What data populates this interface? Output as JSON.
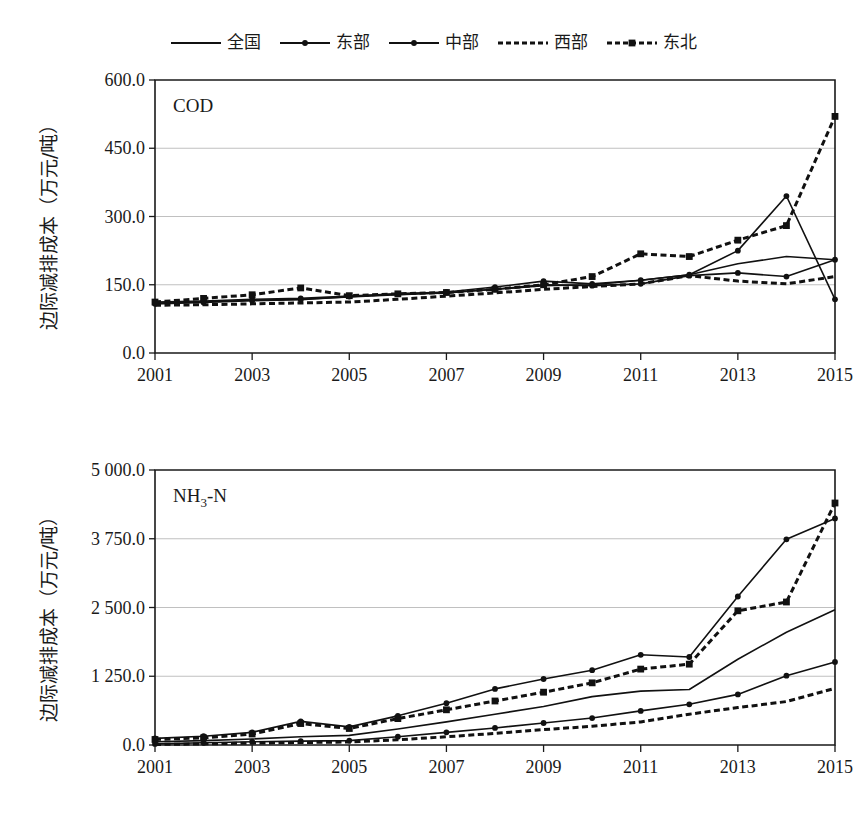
{
  "legend": {
    "entries": [
      {
        "label": "全国",
        "key": "solid-line",
        "style": "solid",
        "marker": "none"
      },
      {
        "label": "东部",
        "key": "solid-line-dot",
        "style": "solid",
        "marker": "circle"
      },
      {
        "label": "中部",
        "key": "solid-line-dot",
        "style": "solid",
        "marker": "circle"
      },
      {
        "label": "西部",
        "key": "dashed-line",
        "style": "dashed",
        "marker": "none"
      },
      {
        "label": "东北",
        "key": "dashed-line-square",
        "style": "dashed",
        "marker": "square"
      }
    ]
  },
  "colors": {
    "ink": "#111111",
    "grid": "#b9b9b9",
    "background": "#ffffff"
  },
  "chart_data": [
    {
      "type": "line",
      "id": "cod",
      "title": "COD",
      "xlabel": "",
      "ylabel": "边际减排成本（万元/吨）",
      "x": [
        2001,
        2002,
        2003,
        2004,
        2005,
        2006,
        2007,
        2008,
        2009,
        2010,
        2011,
        2012,
        2013,
        2014,
        2015
      ],
      "xticks": [
        2001,
        2003,
        2005,
        2007,
        2009,
        2011,
        2013,
        2015
      ],
      "xticklabels": [
        "2001",
        "2003",
        "2005",
        "2007",
        "2009",
        "2011",
        "2013",
        "2015"
      ],
      "yticks": [
        0,
        150,
        300,
        450,
        600
      ],
      "yticklabels": [
        "0.0",
        "150.0",
        "300.0",
        "450.0",
        "600.0"
      ],
      "xlim": [
        2001,
        2015
      ],
      "ylim": [
        0,
        600
      ],
      "grid": true,
      "legend_position": "top-center",
      "series": [
        {
          "name": "全国",
          "style": "solid",
          "marker": "none",
          "values": [
            110,
            112,
            116,
            118,
            123,
            128,
            132,
            140,
            148,
            150,
            160,
            172,
            196,
            212,
            205
          ]
        },
        {
          "name": "东部",
          "style": "solid",
          "marker": "circle",
          "values": [
            108,
            111,
            115,
            117,
            124,
            130,
            134,
            145,
            158,
            152,
            160,
            172,
            225,
            345,
            118
          ]
        },
        {
          "name": "中部",
          "style": "solid",
          "marker": "circle",
          "values": [
            112,
            114,
            118,
            120,
            125,
            130,
            133,
            140,
            150,
            148,
            152,
            170,
            176,
            168,
            205
          ]
        },
        {
          "name": "西部",
          "style": "dashed",
          "marker": "none",
          "values": [
            105,
            106,
            108,
            110,
            112,
            118,
            125,
            132,
            140,
            146,
            152,
            170,
            158,
            152,
            168
          ]
        },
        {
          "name": "东北",
          "style": "dashed",
          "marker": "square",
          "values": [
            112,
            120,
            128,
            143,
            126,
            130,
            133,
            140,
            150,
            168,
            218,
            212,
            248,
            280,
            520
          ]
        }
      ]
    },
    {
      "type": "line",
      "id": "nh3n",
      "title": "NH3-N",
      "title_html": "NH<sub>3</sub>-N",
      "xlabel": "",
      "ylabel": "边际减排成本（万元/吨）",
      "x": [
        2001,
        2002,
        2003,
        2004,
        2005,
        2006,
        2007,
        2008,
        2009,
        2010,
        2011,
        2012,
        2013,
        2014,
        2015
      ],
      "xticks": [
        2001,
        2003,
        2005,
        2007,
        2009,
        2011,
        2013,
        2015
      ],
      "xticklabels": [
        "2001",
        "2003",
        "2005",
        "2007",
        "2009",
        "2011",
        "2013",
        "2015"
      ],
      "yticks": [
        0,
        1250,
        2500,
        3750,
        5000
      ],
      "yticklabels": [
        "0.0",
        "1 250.0",
        "2 500.0",
        "3 750.0",
        "5 000.0"
      ],
      "xlim": [
        2001,
        2015
      ],
      "ylim": [
        0,
        5000
      ],
      "grid": true,
      "legend_position": "top-center",
      "series": [
        {
          "name": "全国",
          "style": "solid",
          "marker": "none",
          "values": [
            60,
            80,
            110,
            150,
            175,
            290,
            420,
            560,
            700,
            880,
            980,
            1010,
            1560,
            2050,
            2460
          ]
        },
        {
          "name": "东部",
          "style": "solid",
          "marker": "circle",
          "values": [
            120,
            160,
            230,
            430,
            330,
            530,
            760,
            1020,
            1200,
            1360,
            1640,
            1600,
            2700,
            3740,
            4120
          ]
        },
        {
          "name": "中部",
          "style": "solid",
          "marker": "circle",
          "values": [
            20,
            40,
            60,
            70,
            80,
            150,
            230,
            310,
            400,
            490,
            620,
            740,
            920,
            1260,
            1510
          ]
        },
        {
          "name": "西部",
          "style": "dashed",
          "marker": "none",
          "values": [
            10,
            20,
            35,
            45,
            55,
            95,
            150,
            210,
            280,
            340,
            420,
            560,
            680,
            790,
            1030
          ]
        },
        {
          "name": "东北",
          "style": "dashed",
          "marker": "square",
          "values": [
            100,
            130,
            200,
            390,
            300,
            480,
            640,
            800,
            960,
            1130,
            1380,
            1470,
            2440,
            2600,
            4400
          ]
        }
      ]
    }
  ]
}
